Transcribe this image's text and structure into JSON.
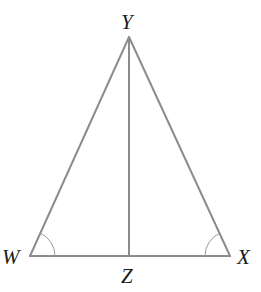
{
  "diagram": {
    "type": "geometry",
    "colors": {
      "line": "#8c8c8c",
      "arc": "#9a9a9a",
      "label": "#1a1a1a",
      "background": "#ffffff"
    },
    "points": {
      "Y": {
        "label": "Y",
        "x": 129,
        "y": 37
      },
      "W": {
        "label": "W",
        "x": 30,
        "y": 256
      },
      "X": {
        "label": "X",
        "x": 230,
        "y": 256
      },
      "Z": {
        "label": "Z",
        "x": 129,
        "y": 256
      }
    },
    "segments": [
      {
        "name": "WY",
        "from": "W",
        "to": "Y"
      },
      {
        "name": "YX",
        "from": "Y",
        "to": "X"
      },
      {
        "name": "WX",
        "from": "W",
        "to": "X"
      },
      {
        "name": "YZ",
        "from": "Y",
        "to": "Z"
      }
    ],
    "angle_marks": [
      {
        "vertex": "W",
        "arcs": 1
      },
      {
        "vertex": "X",
        "arcs": 1
      }
    ],
    "labels": {
      "Y": "Y",
      "W": "W",
      "X": "X",
      "Z": "Z"
    }
  }
}
